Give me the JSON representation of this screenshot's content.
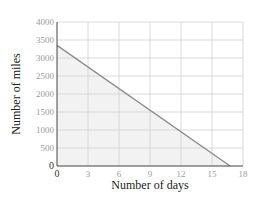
{
  "chart_data": {
    "type": "line",
    "title": "",
    "xlabel": "Number of days",
    "ylabel": "Number of miles",
    "x_ticks": [
      0,
      3,
      6,
      9,
      12,
      15,
      18
    ],
    "y_ticks": [
      0,
      500,
      1000,
      1500,
      2000,
      2500,
      3000,
      3500,
      4000
    ],
    "xlim": [
      0,
      18
    ],
    "ylim": [
      0,
      4000
    ],
    "grid": true,
    "legend": null,
    "series": [
      {
        "name": "Miles remaining",
        "x": [
          0,
          16.75
        ],
        "y": [
          3350,
          0
        ],
        "shaded_below": true
      }
    ],
    "colors": {
      "line": "#8a8a8a",
      "fill": "#f2f2f2",
      "grid": "#d0d0d0",
      "axis": "#444444"
    }
  }
}
